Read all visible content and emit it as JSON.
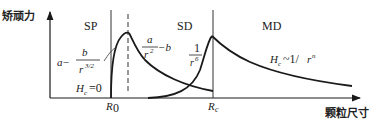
{
  "diagram": {
    "y_axis_label": "矫顽力",
    "x_axis_label": "颗粒尺寸",
    "regions": {
      "sp": "SP",
      "sd": "SD",
      "md": "MD"
    },
    "boundaries": {
      "r0": "R",
      "r0_sub": "0",
      "rc": "R",
      "rc_sub": "c"
    },
    "formulas": {
      "sp_curve": {
        "prefix": "a−",
        "numerator": "b",
        "denominator_base": "r",
        "denominator_exp": "3/2"
      },
      "sd_curve": {
        "numerator": "a",
        "denominator_base": "r",
        "denominator_exp": "2",
        "suffix": "−b"
      },
      "md_rise": {
        "numerator": "1",
        "denominator_base": "r",
        "denominator_exp": "6"
      },
      "md_curve": {
        "hc": "H",
        "hc_sub": "c",
        "relation": "~1/",
        "base": "r",
        "exp": "n"
      },
      "sp_zero": {
        "hc": "H",
        "hc_sub": "c",
        "value": "=0"
      }
    }
  }
}
